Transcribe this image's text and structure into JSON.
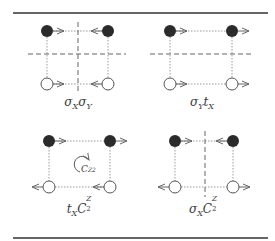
{
  "figure": {
    "colors": {
      "rule": "#333333",
      "filled_circle": "#2b2b2b",
      "open_circle_stroke": "#555555",
      "dotted_line": "#888888",
      "dashed_line": "#666666",
      "arrow": "#666666"
    },
    "panels": [
      {
        "id": "sigmaX-sigmaY",
        "label_main": "σ",
        "label_parts": [
          {
            "text": "σ",
            "sub": "X"
          },
          {
            "text": "σ",
            "sub": "Y"
          }
        ],
        "mirror_lines": [
          "vertical",
          "horizontal"
        ],
        "arrows": {
          "top_left": "right",
          "top_right": "left",
          "bottom_left": "right",
          "bottom_right": "left"
        }
      },
      {
        "id": "sigmaY-tX",
        "label_parts": [
          {
            "text": "σ",
            "sub": "Y"
          },
          {
            "text": "t",
            "sub": "X"
          }
        ],
        "mirror_lines": [
          "horizontal"
        ],
        "arrows": {
          "top_left": "right",
          "top_right": "right",
          "bottom_left": "right",
          "bottom_right": "right"
        }
      },
      {
        "id": "tX-C2Z",
        "label_parts": [
          {
            "text": "t",
            "sub": "X"
          },
          {
            "text": "C",
            "sub": "2",
            "sup": "Z"
          }
        ],
        "mirror_lines": [],
        "rotation_symbol": {
          "text": "C",
          "sub": "2",
          "sup": "Z"
        },
        "arrows": {
          "top_left": "right",
          "top_right": "right",
          "bottom_left": "left",
          "bottom_right": "left"
        }
      },
      {
        "id": "sigmaX-C2Z",
        "label_parts": [
          {
            "text": "σ",
            "sub": "X"
          },
          {
            "text": "C",
            "sub": "2",
            "sup": "Z"
          }
        ],
        "mirror_lines": [
          "vertical"
        ],
        "arrows": {
          "top_left": "right",
          "top_right": "left",
          "bottom_left": "left",
          "bottom_right": "right"
        }
      }
    ],
    "labels": {
      "p1": {
        "a": "σ",
        "a_sub": "X",
        "b": "σ",
        "b_sub": "Y"
      },
      "p2": {
        "a": "σ",
        "a_sub": "Y",
        "b": "t",
        "b_sub": "X"
      },
      "p3": {
        "a": "t",
        "a_sub": "X",
        "b": "C",
        "b_sub": "2",
        "b_sup": "Z"
      },
      "p4": {
        "a": "σ",
        "a_sub": "X",
        "b": "C",
        "b_sub": "2",
        "b_sup": "Z"
      },
      "rotation": {
        "a": "C",
        "a_sub": "2",
        "a_sup": "Z"
      }
    }
  }
}
